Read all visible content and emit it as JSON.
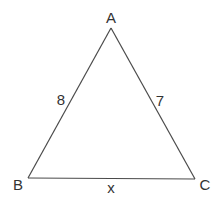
{
  "diagram": {
    "type": "triangle",
    "vertices": {
      "A": {
        "label": "A"
      },
      "B": {
        "label": "B"
      },
      "C": {
        "label": "C"
      }
    },
    "sides": {
      "AB": {
        "label": "8"
      },
      "AC": {
        "label": "7"
      },
      "BC": {
        "label": "x"
      }
    },
    "colors": {
      "line": "#4a4a4a",
      "text": "#333333",
      "background": "#ffffff"
    }
  }
}
